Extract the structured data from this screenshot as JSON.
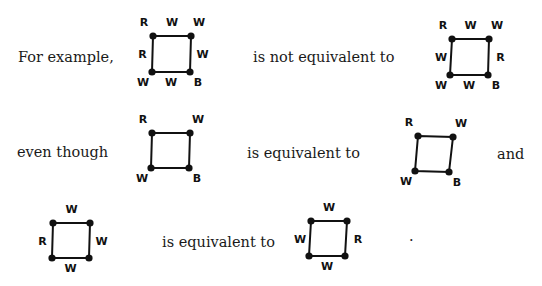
{
  "phrases": {
    "for_example": "For example,",
    "not_equivalent": "is not equivalent to",
    "even_though": "even though",
    "equivalent_row2": "is equivalent to",
    "and": "and",
    "equivalent_row3": "is equivalent to",
    "period": "."
  },
  "squares": [
    {
      "id": "sq1",
      "corners": {
        "tl": [
          153,
          36
        ],
        "tr": [
          191,
          36
        ],
        "br": [
          190,
          72
        ],
        "bl": [
          152,
          72
        ]
      },
      "labels": {
        "tl": "R",
        "top": "W",
        "tr": "W",
        "right": "W",
        "br": "B",
        "bottom": "W",
        "bl": "W",
        "left": "R"
      }
    },
    {
      "id": "sq2",
      "corners": {
        "tl": [
          452,
          39
        ],
        "tr": [
          489,
          39
        ],
        "br": [
          488,
          75
        ],
        "bl": [
          450,
          75
        ]
      },
      "labels": {
        "tl": "R",
        "top": "W",
        "tr": "W",
        "right": "R",
        "br": "B",
        "bottom": "W",
        "bl": "W",
        "left": "W"
      }
    },
    {
      "id": "sq3",
      "corners": {
        "tl": [
          152,
          133
        ],
        "tr": [
          190,
          133
        ],
        "br": [
          189,
          168
        ],
        "bl": [
          151,
          168
        ]
      },
      "labels": {
        "tl": "R",
        "tr": "W",
        "br": "B",
        "bl": "W"
      }
    },
    {
      "id": "sq4",
      "corners": {
        "tl": [
          418,
          136
        ],
        "tr": [
          453,
          137
        ],
        "br": [
          449,
          172
        ],
        "bl": [
          415,
          171
        ]
      },
      "labels": {
        "tl": "R",
        "tr": "W",
        "br": "B",
        "bl": "W"
      }
    },
    {
      "id": "sq5",
      "corners": {
        "tl": [
          53,
          223
        ],
        "tr": [
          90,
          223
        ],
        "br": [
          89,
          258
        ],
        "bl": [
          52,
          258
        ]
      },
      "labels": {
        "top": "W",
        "right": "W",
        "bottom": "W",
        "left": "R"
      }
    },
    {
      "id": "sq6",
      "corners": {
        "tl": [
          311,
          221
        ],
        "tr": [
          347,
          221
        ],
        "br": [
          345,
          256
        ],
        "bl": [
          309,
          256
        ]
      },
      "labels": {
        "top": "W",
        "right": "R",
        "bottom": "W",
        "left": "W"
      }
    }
  ]
}
